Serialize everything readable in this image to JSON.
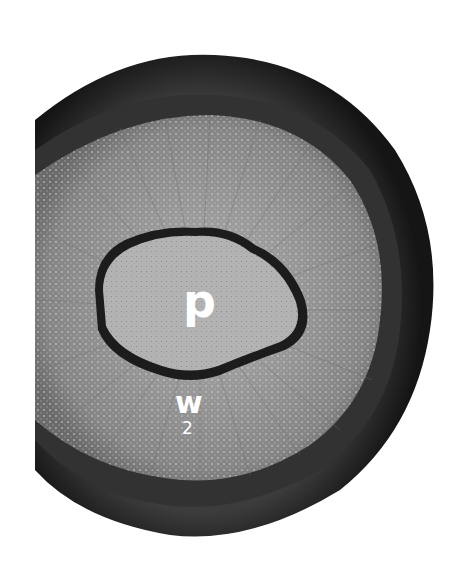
{
  "figure": {
    "type": "micrograph",
    "colors": {
      "background": "#ffffff",
      "bark_outer": "#1a1a1a",
      "bark_inner": "#3a3a3a",
      "xylem": "#8a8a8a",
      "pith": "#b5b5b5",
      "pith_border": "#1c1c1c"
    },
    "labels": {
      "pith": "p",
      "wood": "w",
      "wood_subscript": "2"
    }
  }
}
